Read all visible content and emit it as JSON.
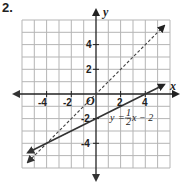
{
  "problem_number": "2.",
  "graph": {
    "x_axis_label": "x",
    "y_axis_label": "y",
    "origin_label": "O",
    "x_ticks": [
      "-4",
      "-2",
      "2",
      "4"
    ],
    "y_ticks": [
      "4",
      "2",
      "-2",
      "-4"
    ],
    "grid_range": {
      "x": [
        -6,
        6
      ],
      "y": [
        -6,
        6
      ]
    },
    "lines": [
      {
        "name": "solid",
        "style": "solid",
        "equation": "y = 1/2 x - 2",
        "label_y": "y",
        "label_eq": "=",
        "label_num": "1",
        "label_den": "2",
        "label_rest": "x − 2"
      },
      {
        "name": "dashed",
        "style": "dashed",
        "equation": "y = x"
      }
    ],
    "colors": {
      "grid": "#b5b5b5",
      "axis": "#222222",
      "line": "#333333"
    }
  }
}
